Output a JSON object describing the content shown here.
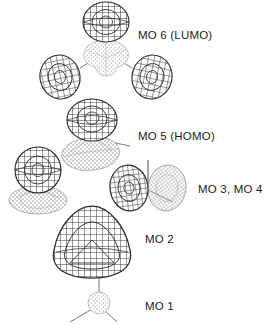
{
  "figure": {
    "background_color": "#ffffff",
    "width": 266,
    "height": 325,
    "line_color": "#2b2b2b",
    "dark_lobe_color": "#3a3a3a",
    "light_lobe_color": "#9a9a9a"
  },
  "labels": {
    "mo6": "MO 6 (LUMO)",
    "mo5": "MO 5 (HOMO)",
    "mo34": "MO 3, MO 4",
    "mo2": "MO 2",
    "mo1": "MO 1"
  },
  "orbitals": [
    {
      "id": "mo6",
      "label": "MO 6 (LUMO)",
      "occupancy": "LUMO",
      "lobe_count": 4,
      "description": "three large dark mesh lobes arranged trigonally around a small light stippled central three-lobed region"
    },
    {
      "id": "mo5",
      "label": "MO 5 (HOMO)",
      "occupancy": "HOMO",
      "lobe_count": 2,
      "description": "one large dark mesh lobe above a flattened light stippled lobe"
    },
    {
      "id": "mo34",
      "label": "MO 3, MO 4",
      "occupancy": "occupied degenerate pair",
      "lobe_count": 2,
      "description": "two adjacent lobes of opposite phase, left dark mesh and right light stippled, separated by a vertical node line"
    },
    {
      "id": "mo2",
      "label": "MO 2",
      "occupancy": "occupied",
      "lobe_count": 1,
      "description": "single rounded triangular dark mesh isosurface enclosing the whole molecule"
    },
    {
      "id": "mo1",
      "label": "MO 1",
      "occupancy": "occupied core",
      "lobe_count": 1,
      "description": "small light stippled sphere at the centre of the three-pronged molecular skeleton"
    }
  ],
  "skeleton": {
    "description": "three-bond Y-shaped molecular framework drawn as thin straight lines",
    "bond_count": 3
  }
}
